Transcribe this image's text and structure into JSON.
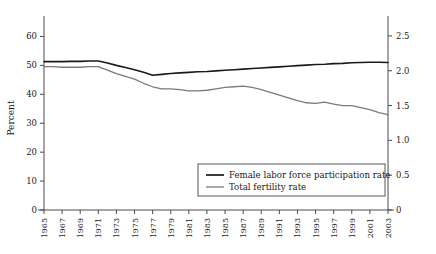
{
  "chart_data": {
    "type": "line",
    "title": "",
    "xlabel": "",
    "ylabel": "Percent",
    "y2label": "",
    "grid": false,
    "legend_position": "inside-bottom-right",
    "xlim": [
      1965,
      2003
    ],
    "ylim": [
      0,
      65
    ],
    "y2lim": [
      0,
      2.7
    ],
    "x": [
      1965,
      1966,
      1967,
      1968,
      1969,
      1970,
      1971,
      1972,
      1973,
      1974,
      1975,
      1976,
      1977,
      1978,
      1979,
      1980,
      1981,
      1982,
      1983,
      1984,
      1985,
      1986,
      1987,
      1988,
      1989,
      1990,
      1991,
      1992,
      1993,
      1994,
      1995,
      1996,
      1997,
      1998,
      1999,
      2000,
      2001,
      2002,
      2003
    ],
    "xtick_labels": [
      "1965",
      "1967",
      "1969",
      "1971",
      "1973",
      "1975",
      "1977",
      "1979",
      "1981",
      "1983",
      "1985",
      "1987",
      "1989",
      "1991",
      "1993",
      "1995",
      "1997",
      "1999",
      "2001",
      "2003"
    ],
    "ytick_labels": [
      "0",
      "10",
      "20",
      "30",
      "40",
      "50",
      "60"
    ],
    "ytick_values": [
      0,
      10,
      20,
      30,
      40,
      50,
      60
    ],
    "y2tick_labels": [
      "0",
      "0.5",
      "1.0",
      "1.5",
      "2.0",
      "2.5"
    ],
    "y2tick_values": [
      0,
      0.5,
      1.0,
      1.5,
      2.0,
      2.5
    ],
    "series": [
      {
        "name": "Female labor force participation rate",
        "axis": "left",
        "color": "#1a1a1a",
        "width": 1.6,
        "units": "percent",
        "values": [
          51.3,
          51.3,
          51.3,
          51.4,
          51.4,
          51.5,
          51.5,
          50.8,
          50.0,
          49.3,
          48.5,
          47.6,
          46.6,
          46.9,
          47.2,
          47.4,
          47.6,
          47.8,
          47.9,
          48.1,
          48.3,
          48.5,
          48.7,
          48.9,
          49.1,
          49.3,
          49.5,
          49.7,
          49.9,
          50.1,
          50.3,
          50.4,
          50.6,
          50.7,
          50.9,
          51.0,
          51.1,
          51.1,
          51.0
        ]
      },
      {
        "name": "Total fertility rate",
        "axis": "right",
        "color": "#7a7a7a",
        "width": 1.3,
        "units": "births per woman",
        "values": [
          2.06,
          2.06,
          2.05,
          2.05,
          2.05,
          2.06,
          2.06,
          2.01,
          1.96,
          1.92,
          1.88,
          1.82,
          1.77,
          1.74,
          1.74,
          1.73,
          1.71,
          1.71,
          1.72,
          1.74,
          1.76,
          1.77,
          1.78,
          1.76,
          1.73,
          1.69,
          1.65,
          1.61,
          1.57,
          1.54,
          1.53,
          1.55,
          1.52,
          1.5,
          1.5,
          1.47,
          1.44,
          1.4,
          1.37
        ]
      }
    ],
    "legend_entries": [
      {
        "label": "Female labor force participation rate",
        "color": "#1a1a1a"
      },
      {
        "label": "Total fertility rate",
        "color": "#7a7a7a"
      }
    ]
  }
}
